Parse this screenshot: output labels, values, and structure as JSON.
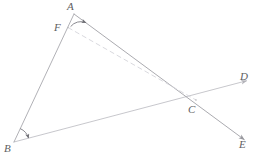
{
  "figure": {
    "width": 264,
    "height": 160,
    "background": "#ffffff",
    "colors": {
      "line_dark": "#8d8d93",
      "line_mid": "#a8a8ae",
      "line_light": "#c9c9cf",
      "line_faint": "#d8d8dd",
      "label": "#5e5e62",
      "arc": "#7a7a80"
    }
  },
  "points": [
    {
      "id": "A",
      "label": "A",
      "x": 74,
      "y": 14,
      "label_x": 67,
      "label_y": 1
    },
    {
      "id": "F",
      "label": "F",
      "x": 68,
      "y": 27,
      "label_x": 54,
      "label_y": 22
    },
    {
      "id": "B",
      "label": "B",
      "x": 14,
      "y": 142,
      "label_x": 4,
      "label_y": 143
    },
    {
      "id": "C",
      "label": "C",
      "x": 196,
      "y": 100,
      "label_x": 188,
      "label_y": 104
    },
    {
      "id": "D",
      "label": "D",
      "x": 250,
      "y": 80,
      "label_x": 240,
      "label_y": 71
    },
    {
      "id": "E",
      "label": "E",
      "x": 248,
      "y": 143,
      "label_x": 239,
      "label_y": 139
    }
  ],
  "segments": [
    {
      "id": "AB",
      "from": "A",
      "to": "B",
      "style": "solid",
      "shade": "mid"
    },
    {
      "id": "AE",
      "from": "A",
      "to": "E",
      "style": "solid",
      "shade": "dark",
      "arrow_end": true
    },
    {
      "id": "BD",
      "from": "B",
      "to": "D",
      "style": "solid",
      "shade": "light",
      "arrow_end": true
    },
    {
      "id": "FC",
      "from": "F",
      "to": "C",
      "style": "dashed",
      "shade": "faint"
    }
  ],
  "angle_marks": [
    {
      "id": "angle-A",
      "at": "A",
      "marker": "arrow"
    },
    {
      "id": "angle-B",
      "at": "B",
      "marker": "arrow"
    }
  ]
}
